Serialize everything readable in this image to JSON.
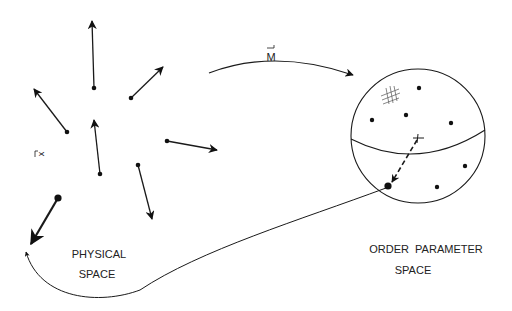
{
  "diagram": {
    "labels": {
      "physical_space_line1": "PHYSICAL",
      "physical_space_line2": "SPACE",
      "order_parameter_line1": "ORDER  PARAMETER",
      "order_parameter_line2": "SPACE",
      "map_symbol": "M",
      "position_symbol": "x"
    },
    "physical_space": {
      "spins": [
        {
          "from": [
            94,
            88
          ],
          "to": [
            92,
            20
          ]
        },
        {
          "from": [
            131,
            98
          ],
          "to": [
            164,
            66
          ]
        },
        {
          "from": [
            67,
            132
          ],
          "to": [
            33,
            88
          ]
        },
        {
          "from": [
            100,
            174
          ],
          "to": [
            94,
            120
          ]
        },
        {
          "from": [
            167,
            141
          ],
          "to": [
            218,
            150
          ]
        },
        {
          "from": [
            138,
            165
          ],
          "to": [
            152,
            220
          ]
        },
        {
          "from": [
            58,
            198
          ],
          "to": [
            30,
            245
          ]
        }
      ]
    },
    "order_parameter_space": {
      "shape": "sphere",
      "points": [
        [
          419,
          88
        ],
        [
          372,
          120
        ],
        [
          406,
          115
        ],
        [
          451,
          123
        ],
        [
          465,
          166
        ],
        [
          437,
          187
        ]
      ],
      "highlight_point": [
        388,
        186
      ],
      "center_mark": [
        418,
        138
      ]
    },
    "colors": {
      "ink": "#1a1a1a",
      "background": "#ffffff"
    }
  }
}
